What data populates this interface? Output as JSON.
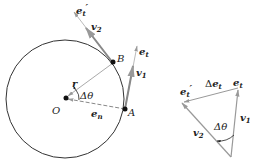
{
  "diagram": {
    "title": "",
    "colors": {
      "circle": "#333333",
      "vector": "#999999",
      "point": "#111111",
      "text": "#222222"
    },
    "left": {
      "points": {
        "O": "O",
        "A": "A",
        "B": "B"
      },
      "labels": {
        "e_t_prime": "e",
        "e_t_prime_sub": "t",
        "e_t_prime_mark": "′",
        "v2": "v",
        "v2_sub": "2",
        "e_t": "e",
        "e_t_sub": "t",
        "v1": "v",
        "v1_sub": "1",
        "r": "r",
        "delta_theta": "Δθ",
        "e_n": "e",
        "e_n_sub": "n"
      }
    },
    "right": {
      "labels": {
        "e_t_prime": "e",
        "e_t_prime_sub": "t",
        "e_t_prime_mark": "′",
        "delta_e_t_delta": "Δ",
        "delta_e_t": "e",
        "delta_e_t_sub": "t",
        "e_t": "e",
        "e_t_sub": "t",
        "v1": "v",
        "v1_sub": "1",
        "v2": "v",
        "v2_sub": "2",
        "delta_theta": "Δθ"
      }
    }
  }
}
